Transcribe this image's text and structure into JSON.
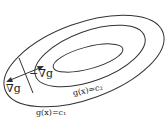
{
  "diagram": {
    "title": "",
    "level_curves": [
      {
        "label": "g(x)=c₁",
        "name": "outer"
      },
      {
        "label": "g(x)=c₂",
        "name": "middle"
      },
      {
        "name": "inner"
      }
    ],
    "labels": {
      "neg_grad": "−∇g",
      "grad": "∇g",
      "c2": "g(x)=c₂",
      "c1": "g(x)=c₁"
    },
    "colors": {
      "stroke": "#333333",
      "background": "#ffffff"
    }
  }
}
